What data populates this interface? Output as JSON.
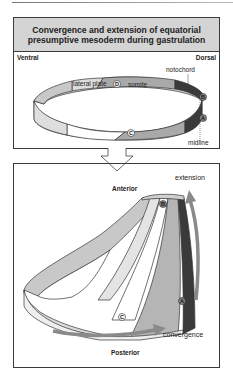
{
  "title": "Convergence and extension of equatorial presumptive mesoderm during gastrulation",
  "top_panel": {
    "orientation_left": "Ventral",
    "orientation_right": "Dorsal",
    "labels": {
      "lateral_plate": "lateral plate",
      "somite": "somite",
      "notochord": "notochord",
      "midline": "midline"
    },
    "markers": [
      "A",
      "B",
      "C",
      "D"
    ]
  },
  "bottom_panel": {
    "anterior": "Anterior",
    "posterior": "Posterior",
    "extension": "extension",
    "convergence": "convergence",
    "markers": [
      "A",
      "B",
      "C"
    ]
  },
  "colors": {
    "notochord": "#3a3a3a",
    "somite": "#a9a9a9",
    "lateral_plate": "#d6d6d6",
    "ventral": "#f4f4f4",
    "arrow": "#8a8a8a",
    "header_bg": "#d4d4d4"
  }
}
